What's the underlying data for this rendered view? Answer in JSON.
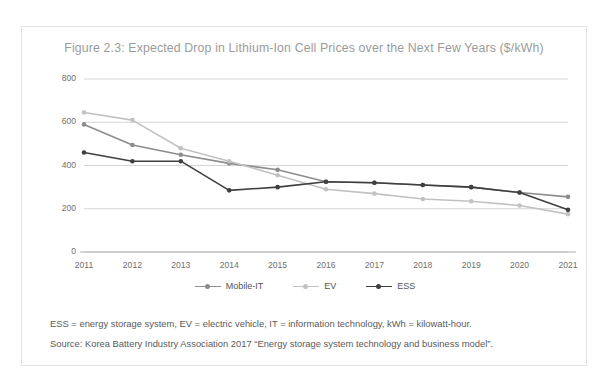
{
  "figure": {
    "title": "Figure 2.3: Expected Drop in Lithium-Ion Cell Prices over the Next Few Years ($/kWh)",
    "notes": [
      "ESS = energy storage system, EV = electric vehicle, IT = information technology, kWh = kilowatt-hour.",
      "Source: Korea Battery Industry Association 2017 “Energy storage system technology and business model”."
    ]
  },
  "colors": {
    "series_mobile_it": "#8c8c8c",
    "series_ev": "#c2c2c2",
    "series_ess": "#3f3f3f",
    "gridline": "#d6d6d6",
    "axis": "#b0b0b0",
    "title_text": "#9b9b9b",
    "tick_text": "#6f6f6f",
    "card_border": "#e3e3e3",
    "background": "#ffffff"
  },
  "chart_data": {
    "type": "line",
    "title": "Figure 2.3: Expected Drop in Lithium-Ion Cell Prices over the Next Few Years ($/kWh)",
    "xlabel": "",
    "ylabel": "",
    "categories": [
      "2011",
      "2012",
      "2013",
      "2014",
      "2015",
      "2016",
      "2017",
      "2018",
      "2019",
      "2020",
      "2021"
    ],
    "ylim": [
      0,
      800
    ],
    "yticks": [
      0,
      200,
      400,
      600,
      800
    ],
    "grid": true,
    "legend_position": "bottom",
    "series": [
      {
        "name": "Mobile-IT",
        "color": "#8c8c8c",
        "values": [
          590,
          495,
          450,
          410,
          380,
          325,
          320,
          310,
          300,
          275,
          255
        ]
      },
      {
        "name": "EV",
        "color": "#c2c2c2",
        "values": [
          645,
          610,
          480,
          420,
          355,
          290,
          270,
          245,
          235,
          215,
          175
        ]
      },
      {
        "name": "ESS",
        "color": "#3f3f3f",
        "values": [
          460,
          420,
          420,
          285,
          300,
          325,
          320,
          310,
          300,
          275,
          195
        ]
      }
    ]
  }
}
